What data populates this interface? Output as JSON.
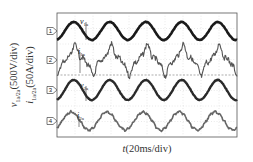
{
  "chart_data": {
    "type": "line",
    "title": "",
    "xlabel": "t(20ms/div)",
    "ylabel": "v1a/2a(500V/div) i1a/2a(50A/div)",
    "ylabel_lines": [
      {
        "var": "v",
        "sub": "1a/2a",
        "unit": "(500V/div)"
      },
      {
        "var": "i",
        "sub": "1a/2a",
        "unit": "(50A/div)"
      }
    ],
    "xlabel_parts": {
      "var": "t",
      "unit": "(20ms/div)"
    },
    "grid": true,
    "time_per_div_ms": 20,
    "cycles_visible": 5,
    "series": [
      {
        "name": "v1a",
        "label_var": "v",
        "label_sub": "1a",
        "channel": "1",
        "scale": "500V/div",
        "waveform": "sinusoidal",
        "noise": "low",
        "color": "#1a1a1a",
        "width": 2.6,
        "center_y": 31,
        "amplitude_px": 9,
        "phase_deg": 0
      },
      {
        "name": "i1a",
        "label_var": "i",
        "label_sub": "1a",
        "channel": "2",
        "scale": "50A/div",
        "waveform": "distorted sinusoidal with harmonics",
        "noise": "high",
        "color": "#555555",
        "width": 1.1,
        "center_y": 60,
        "amplitude_px": 13,
        "phase_deg": 0
      },
      {
        "name": "v2a",
        "label_var": "v",
        "label_sub": "2a",
        "channel": "3",
        "scale": "500V/div",
        "waveform": "sinusoidal",
        "noise": "low",
        "color": "#2a2a2a",
        "width": 2.4,
        "center_y": 90,
        "amplitude_px": 10,
        "phase_deg": 0
      },
      {
        "name": "i2a",
        "label_var": "i",
        "label_sub": "2a",
        "channel": "4",
        "scale": "50A/div",
        "waveform": "sinusoidal with ripple",
        "noise": "medium",
        "color": "#666666",
        "width": 1.6,
        "center_y": 121,
        "amplitude_px": 9,
        "phase_deg": 30
      }
    ],
    "annotations": [
      {
        "text_var": "v",
        "text_sub": "1a",
        "x": 80,
        "y": 18
      },
      {
        "text_var": "i",
        "text_sub": "1a",
        "x": 78,
        "y": 48
      },
      {
        "text_var": "v",
        "text_sub": "2a",
        "x": 80,
        "y": 82
      },
      {
        "text_var": "i",
        "text_sub": "2a",
        "x": 77,
        "y": 112
      }
    ],
    "channel_markers": [
      "1",
      "2",
      "3",
      "4"
    ]
  }
}
